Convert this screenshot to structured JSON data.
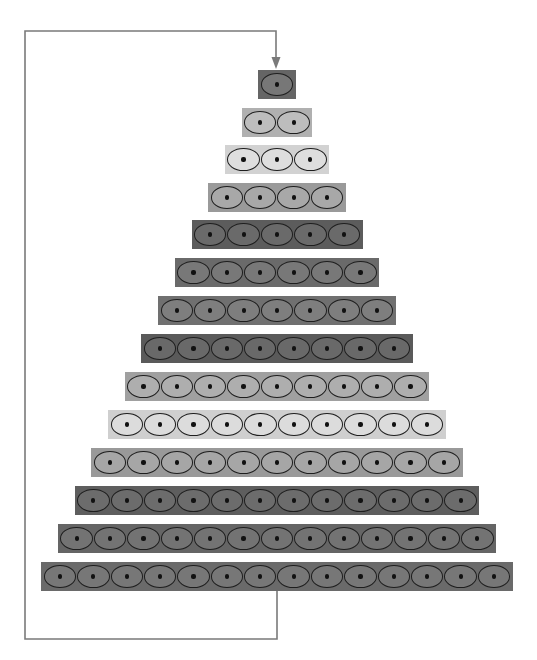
{
  "diagram": {
    "type": "stacked-pyramid-with-feedback-loop",
    "row_count": 14,
    "cell_pitch_px": 33.4,
    "row_height_px": 29,
    "center_x": 277,
    "rows": [
      {
        "index": 1,
        "cells": 1,
        "top": 70,
        "bg": "#656565",
        "fill": "#777777"
      },
      {
        "index": 2,
        "cells": 2,
        "top": 108,
        "bg": "#b0b0b0",
        "fill": "#bdbdbd"
      },
      {
        "index": 3,
        "cells": 3,
        "top": 145,
        "bg": "#d2d2d2",
        "fill": "#dedede"
      },
      {
        "index": 4,
        "cells": 4,
        "top": 183,
        "bg": "#9a9a9a",
        "fill": "#a8a8a8"
      },
      {
        "index": 5,
        "cells": 5,
        "top": 220,
        "bg": "#5c5c5c",
        "fill": "#6a6a6a"
      },
      {
        "index": 6,
        "cells": 6,
        "top": 258,
        "bg": "#6a6a6a",
        "fill": "#787878"
      },
      {
        "index": 7,
        "cells": 7,
        "top": 296,
        "bg": "#707070",
        "fill": "#7e7e7e"
      },
      {
        "index": 8,
        "cells": 8,
        "top": 334,
        "bg": "#5a5a5a",
        "fill": "#696969"
      },
      {
        "index": 9,
        "cells": 9,
        "top": 372,
        "bg": "#a0a0a0",
        "fill": "#aeaeae"
      },
      {
        "index": 10,
        "cells": 10,
        "top": 410,
        "bg": "#cfcfcf",
        "fill": "#dcdcdc"
      },
      {
        "index": 11,
        "cells": 11,
        "top": 448,
        "bg": "#999999",
        "fill": "#a6a6a6"
      },
      {
        "index": 12,
        "cells": 12,
        "top": 486,
        "bg": "#5e5e5e",
        "fill": "#6c6c6c"
      },
      {
        "index": 13,
        "cells": 13,
        "top": 524,
        "bg": "#656565",
        "fill": "#737373"
      },
      {
        "index": 14,
        "cells": 14,
        "top": 562,
        "bg": "#6a6a6a",
        "fill": "#777777"
      }
    ],
    "connector": {
      "color": "#7a7a7a",
      "description": "feedback line from bottom row back to top cell",
      "points": [
        [
          277,
          591
        ],
        [
          277,
          639
        ],
        [
          25,
          639
        ],
        [
          25,
          31
        ],
        [
          276,
          31
        ],
        [
          276,
          68
        ]
      ],
      "arrowhead": "down"
    }
  }
}
